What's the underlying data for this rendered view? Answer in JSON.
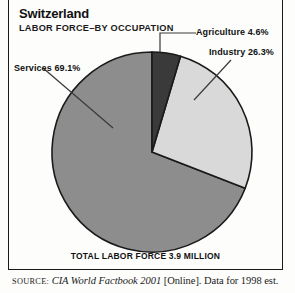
{
  "header": {
    "country": "Switzerland",
    "subject": "LABOR FORCE–BY OCCUPATION"
  },
  "footer": {
    "total_caption": "TOTAL LABOR FORCE 3.9 MILLION",
    "source_label": "SOURCE:",
    "source_publication": "CIA World Factbook 2001",
    "source_rest": "[Online]. Data for 1998 est."
  },
  "callouts": {
    "agriculture": "Agriculture 4.6%",
    "industry": "Industry 26.3%",
    "services": "Services 69.1%"
  },
  "colors": {
    "agriculture": "#3a3a3a",
    "industry": "#d9d9d9",
    "services": "#8d8d8d",
    "outline": "#1a1a1a",
    "page_background": "#fdfdfc",
    "text": "#111111"
  },
  "chart_data": {
    "type": "pie",
    "title": "Switzerland LABOR FORCE–BY OCCUPATION",
    "subtitle": "TOTAL LABOR FORCE 3.9 MILLION",
    "xlabel": "",
    "ylabel": "",
    "legend_position": "callout-labels",
    "grid": false,
    "units": "percent",
    "total_label": "TOTAL LABOR FORCE 3.9 MILLION",
    "total_value": 3.9,
    "total_units": "million workers",
    "start_angle_deg": 0,
    "direction": "clockwise",
    "categories": [
      "Agriculture",
      "Industry",
      "Services"
    ],
    "values": [
      4.6,
      26.3,
      69.1
    ],
    "slices": [
      {
        "label": "Agriculture",
        "value": 4.6,
        "display": "Agriculture 4.6%",
        "color": "#3a3a3a"
      },
      {
        "label": "Industry",
        "value": 26.3,
        "display": "Industry 26.3%",
        "color": "#d9d9d9"
      },
      {
        "label": "Services",
        "value": 69.1,
        "display": "Services 69.1%",
        "color": "#8d8d8d"
      }
    ],
    "annotations": [
      "Agriculture 4.6%",
      "Industry 26.3%",
      "Services 69.1%",
      "TOTAL LABOR FORCE 3.9 MILLION"
    ]
  }
}
